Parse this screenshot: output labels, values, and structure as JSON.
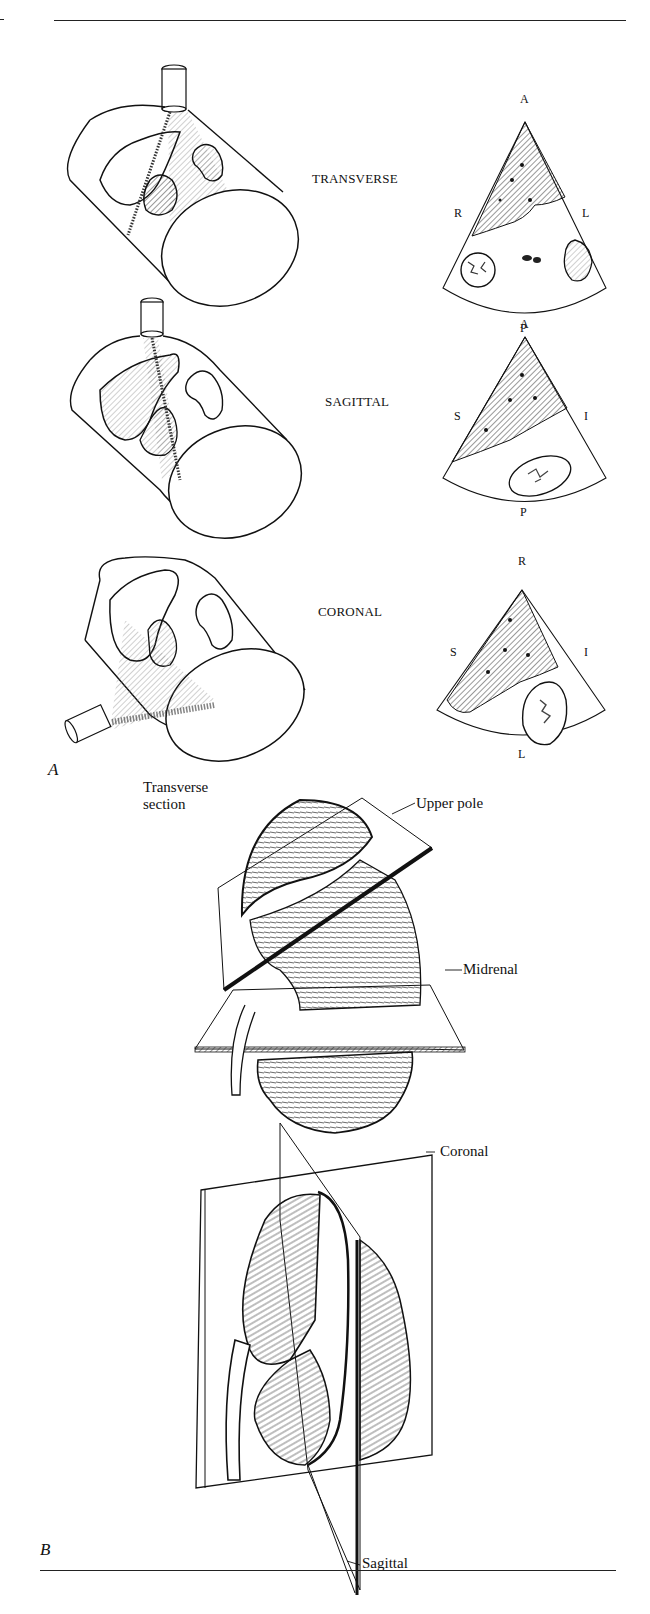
{
  "figure": {
    "panel_labels": {
      "a": "A",
      "b": "B"
    },
    "panel_a": {
      "rows": [
        {
          "plane": "TRANSVERSE",
          "orientation": {
            "top": "A",
            "left": "R",
            "right": "L",
            "bottom": "P"
          }
        },
        {
          "plane": "SAGITTAL",
          "orientation": {
            "top": "A",
            "left": "S",
            "right": "I",
            "bottom": "P"
          }
        },
        {
          "plane": "CORONAL",
          "orientation": {
            "top": "R",
            "left": "S",
            "right": "I",
            "bottom": "L"
          }
        }
      ]
    },
    "panel_b": {
      "transverse": {
        "title_line1": "Transverse",
        "title_line2": "section",
        "callouts": {
          "upper_pole": "Upper pole",
          "midrenal": "Midrenal"
        }
      },
      "longitudinal": {
        "callouts": {
          "coronal": "Coronal",
          "sagittal": "Sagittal"
        }
      }
    },
    "colors": {
      "ink": "#111111",
      "background": "#ffffff",
      "hatch": "#333333"
    }
  }
}
